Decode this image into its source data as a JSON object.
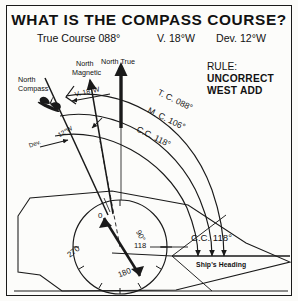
{
  "diagram": {
    "title": "WHAT IS THE COMPASS COURSE?",
    "header": {
      "true_course": "True Course 088°",
      "variation": "V. 18°W",
      "deviation": "Dev. 12°W"
    },
    "rule": {
      "label": "RULE:",
      "line1": "UNCORRECT",
      "line2": "WEST ADD"
    },
    "north_labels": {
      "compass_line1": "North",
      "compass_line2": "Compass",
      "magnetic_line1": "North",
      "magnetic_line2": "Magnetic",
      "true": "North True"
    },
    "angle_labels": {
      "variation_arc": "V. 18°W",
      "deviation_arc": "12°W",
      "deviation_caption": "Dev."
    },
    "course_arcs": [
      {
        "label": "T. C. 088°",
        "value": 88,
        "name": "true-course"
      },
      {
        "label": "M. C. 106°",
        "value": 106,
        "name": "magnetic-course"
      },
      {
        "label": "C.C. 118°",
        "value": 118,
        "name": "compass-course"
      }
    ],
    "compass_rose": {
      "marks": [
        "0",
        "90°",
        "118",
        "180",
        "270"
      ],
      "zero": "0",
      "ninety": "90°",
      "reading": "118",
      "oneeighty": "180",
      "twoseventy": "270"
    },
    "bottom": {
      "compass_course": "C.C. 118°",
      "ships_heading": "Ship's Heading"
    },
    "colors": {
      "ink": "#1a1a1a",
      "paper": "#fcfcfa"
    }
  }
}
